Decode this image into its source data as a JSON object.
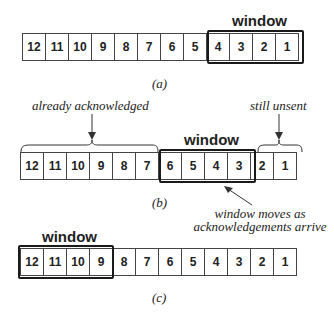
{
  "diagram": {
    "panels": [
      {
        "id": "a",
        "caption": "(a)",
        "cells": [
          "12",
          "11",
          "10",
          "9",
          "8",
          "7",
          "6",
          "5",
          "4",
          "3",
          "2",
          "1"
        ],
        "window_label": "window",
        "window_cells": [
          "4",
          "3",
          "2",
          "1"
        ]
      },
      {
        "id": "b",
        "caption": "(b)",
        "cells": [
          "12",
          "11",
          "10",
          "9",
          "8",
          "7",
          "6",
          "5",
          "4",
          "3",
          "2",
          "1"
        ],
        "window_label": "window",
        "window_cells": [
          "6",
          "5",
          "4",
          "3"
        ],
        "annotations": {
          "left_brace": "already acknowledged",
          "right_brace": "still unsent",
          "arrow_note_line1": "window moves as",
          "arrow_note_line2": "acknowledgements arrive"
        }
      },
      {
        "id": "c",
        "caption": "(c)",
        "cells": [
          "12",
          "11",
          "10",
          "9",
          "8",
          "7",
          "6",
          "5",
          "4",
          "3",
          "2",
          "1"
        ],
        "window_label": "window",
        "window_cells": [
          "12",
          "11",
          "10",
          "9"
        ]
      }
    ]
  }
}
